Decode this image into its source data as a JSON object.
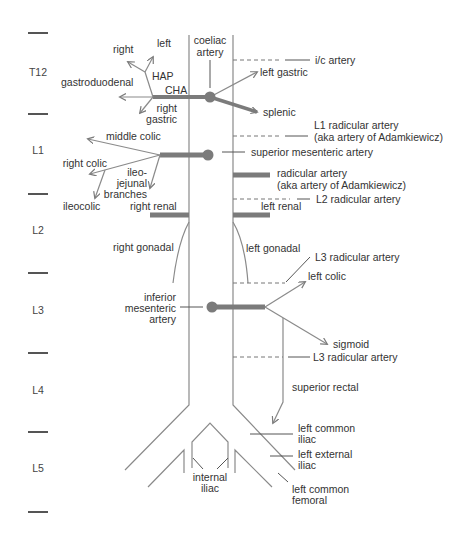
{
  "diagram": {
    "colors": {
      "line": "#8a8a8a",
      "thick_vessel": "#7b7b7b",
      "text": "#333333",
      "background": "#ffffff"
    },
    "vertebral_levels": [
      "T12",
      "L1",
      "L2",
      "L3",
      "L4",
      "L5"
    ],
    "coeliac_trunk": {
      "line1": "coeliac",
      "line2": "artery"
    },
    "hepatic": {
      "right": "right",
      "left": "left",
      "hap": "HAP",
      "cha": "CHA",
      "gastroduodenal": "gastroduodenal",
      "right_gastric_line1": "right",
      "right_gastric_line2": "gastric"
    },
    "left_gastric": "left gastric",
    "splenic": "splenic",
    "ic_artery": "i/c artery",
    "l1_radicular": {
      "line1": "L1 radicular artery",
      "line2": "(aka artery of Adamkiewicz)"
    },
    "sma": {
      "label": "superior mesenteric artery",
      "middle_colic": "middle colic",
      "right_colic": "right colic",
      "ileojejunal_line1": "ileo-",
      "ileojejunal_line2": "jejunal",
      "ileojejunal_line3": "branches",
      "ileocolic": "ileocolic"
    },
    "radicular": {
      "line1": "radicular artery",
      "line2": "(aka artery of Adamkiewicz)"
    },
    "l2_radicular": "L2 radicular artery",
    "renal": {
      "right": "right renal",
      "left": "left renal"
    },
    "gonadal": {
      "right": "right gonadal",
      "left": "left gonadal"
    },
    "l3_radicular_upper": "L3 radicular artery",
    "ima": {
      "line1": "inferior",
      "line2": "mesenteric",
      "line3": "artery",
      "left_colic": "left colic",
      "sigmoid": "sigmoid",
      "superior_rectal": "superior rectal"
    },
    "l3_radicular_lower": "L3 radicular artery",
    "iliac": {
      "left_common_line1": "left common",
      "left_common_line2": "iliac",
      "left_external_line1": "left external",
      "left_external_line2": "iliac",
      "internal_line1": "internal",
      "internal_line2": "iliac",
      "femoral_line1": "left common",
      "femoral_line2": "femoral"
    }
  }
}
